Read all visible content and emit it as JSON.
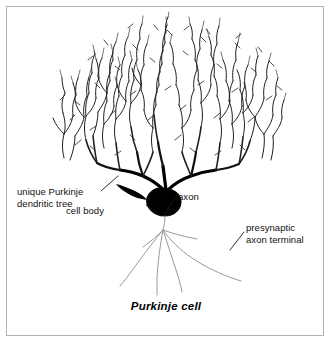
{
  "figure": {
    "caption": "Purkinje cell",
    "border_color": "#b3b3b3",
    "background_color": "#ffffff",
    "ink_color": "#1a1a1a",
    "soma_color": "#000000",
    "axon_color": "#9a9a9a"
  },
  "labels": {
    "dendritic_tree_line1": "unique Purkinje",
    "dendritic_tree_line2": "dendritic tree",
    "cell_body": "cell body",
    "axon": "axon",
    "presynaptic_line1": "presynaptic",
    "presynaptic_line2": "axon terminal"
  },
  "diagram": {
    "type": "neuron-anatomy",
    "subject": "Purkinje cell",
    "parts": [
      "dendritic tree",
      "cell body",
      "axon",
      "presynaptic axon terminal"
    ]
  }
}
